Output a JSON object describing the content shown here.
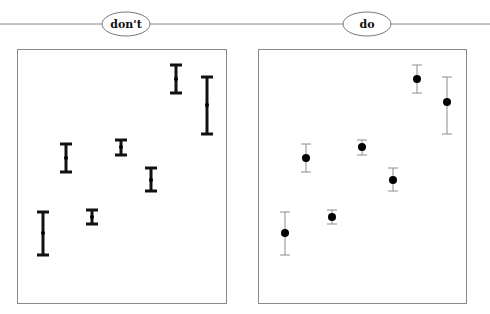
{
  "panels": [
    {
      "id": "dont",
      "label": "don't",
      "style": "heavy error bars, small points"
    },
    {
      "id": "do",
      "label": "do",
      "style": "light error bars, prominent points"
    }
  ],
  "colors": {
    "rule_line": "#888888",
    "frame": "#8a8a8a",
    "dont_bar": "#111111",
    "do_bar": "#8c8c8c",
    "point": "#000000"
  },
  "chart_data": [
    {
      "type": "scatter",
      "title": "don't",
      "xlabel": "",
      "ylabel": "",
      "grid": false,
      "ylim": [
        0,
        100
      ],
      "x": [
        1,
        2,
        3,
        4,
        5,
        6,
        7
      ],
      "series": [
        {
          "name": "values",
          "values": [
            28,
            57,
            34,
            62,
            49,
            88,
            78
          ],
          "error_low": [
            19,
            52,
            31,
            58,
            44,
            83,
            67
          ],
          "error_high": [
            36,
            63,
            37,
            64,
            53,
            94,
            89
          ]
        }
      ]
    },
    {
      "type": "scatter",
      "title": "do",
      "xlabel": "",
      "ylabel": "",
      "grid": false,
      "ylim": [
        0,
        100
      ],
      "x": [
        1,
        2,
        3,
        4,
        5,
        6,
        7
      ],
      "series": [
        {
          "name": "values",
          "values": [
            28,
            57,
            34,
            62,
            49,
            88,
            79
          ],
          "error_low": [
            19,
            52,
            31,
            58,
            44,
            83,
            67
          ],
          "error_high": [
            36,
            63,
            37,
            64,
            53,
            94,
            89
          ]
        }
      ]
    }
  ],
  "pixel_points": {
    "dont": [
      {
        "x": 43,
        "y": 233,
        "top": 212,
        "bottom": 255
      },
      {
        "x": 66,
        "y": 158,
        "top": 144,
        "bottom": 172
      },
      {
        "x": 92,
        "y": 217,
        "top": 210,
        "bottom": 224
      },
      {
        "x": 121,
        "y": 147,
        "top": 140,
        "bottom": 155
      },
      {
        "x": 151,
        "y": 180,
        "top": 168,
        "bottom": 191
      },
      {
        "x": 176,
        "y": 79,
        "top": 65,
        "bottom": 93
      },
      {
        "x": 207,
        "y": 105,
        "top": 77,
        "bottom": 134
      }
    ],
    "do": [
      {
        "x": 40,
        "y": 233,
        "top": 212,
        "bottom": 255
      },
      {
        "x": 61,
        "y": 158,
        "top": 144,
        "bottom": 172
      },
      {
        "x": 87,
        "y": 217,
        "top": 210,
        "bottom": 224
      },
      {
        "x": 117,
        "y": 147,
        "top": 140,
        "bottom": 155
      },
      {
        "x": 148,
        "y": 180,
        "top": 168,
        "bottom": 191
      },
      {
        "x": 172,
        "y": 79,
        "top": 65,
        "bottom": 93
      },
      {
        "x": 202,
        "y": 102,
        "top": 77,
        "bottom": 134
      }
    ]
  }
}
